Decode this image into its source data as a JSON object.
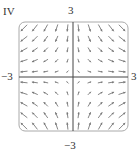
{
  "panel": {
    "label": "IV"
  },
  "chart_data": {
    "type": "vector_field",
    "title": "",
    "panel_label": "IV",
    "field": {
      "u": "x",
      "v": "-y"
    },
    "xlim": [
      -3,
      3
    ],
    "ylim": [
      -3,
      3
    ],
    "tick_labels": {
      "x_min": "−3",
      "x_max": "3",
      "y_min": "−3",
      "y_max": "3"
    },
    "grid_points": [
      -3,
      -2.4,
      -1.8,
      -1.2,
      -0.6,
      0,
      0.6,
      1.2,
      1.8,
      2.4,
      3
    ],
    "arrow_color": "#777777",
    "axis_color": "#444444",
    "frame_color": "#aaaaaa"
  }
}
